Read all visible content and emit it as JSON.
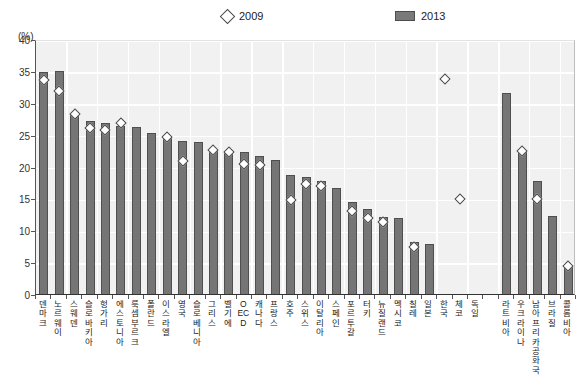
{
  "chart_data": {
    "type": "bar",
    "title": "",
    "xlabel": "",
    "ylabel": "(%)",
    "ylim": [
      0,
      40
    ],
    "yticks": [
      0,
      5,
      10,
      15,
      20,
      25,
      30,
      35,
      40
    ],
    "grid": true,
    "legend_position": "top",
    "categories": [
      "덴마크",
      "노르웨이",
      "스웨덴",
      "슬로바키아",
      "헝가리",
      "에스토니아",
      "룩셈부르크",
      "폴란드",
      "이스라엘",
      "영국",
      "슬로베니아",
      "그리스",
      "벨기에",
      "OECD",
      "캐나다",
      "프랑스",
      "호주",
      "스위스",
      "이탈리아",
      "스페인",
      "포르투갈",
      "터키",
      "뉴질랜드",
      "멕시코",
      "칠레",
      "일본",
      "한국",
      "체코",
      "독일",
      "",
      "라트비아",
      "우크라이나",
      "남아프리카공화국",
      "브라질",
      "콜롬비아"
    ],
    "series": [
      {
        "name": "2013",
        "marker": "bar",
        "color": "#757575",
        "values": [
          34.8,
          35.0,
          28.3,
          27.1,
          26.8,
          26.4,
          26.2,
          25.3,
          24.8,
          24.0,
          23.9,
          22.6,
          22.5,
          22.2,
          21.6,
          21.0,
          18.7,
          18.3,
          17.7,
          16.7,
          14.4,
          13.3,
          12.1,
          11.9,
          8.1,
          7.8,
          null,
          null,
          null,
          null,
          31.5,
          22.2,
          17.8,
          12.2,
          4.3
        ]
      },
      {
        "name": "2009",
        "marker": "diamond",
        "color": "#ffffff",
        "values": [
          34.2,
          32.4,
          28.9,
          26.7,
          26.3,
          27.5,
          null,
          null,
          25.3,
          21.5,
          null,
          23.2,
          22.9,
          21.0,
          20.9,
          null,
          15.3,
          17.9,
          17.5,
          null,
          13.6,
          12.6,
          12.0,
          null,
          8.0,
          null,
          34.3,
          15.6,
          null,
          null,
          null,
          23.0,
          15.5,
          null,
          5.0
        ]
      }
    ]
  },
  "legend": {
    "items": [
      {
        "label": "2009",
        "marker": "diamond"
      },
      {
        "label": "2013",
        "marker": "bar"
      }
    ]
  },
  "axis": {
    "unit_label": "(%)"
  },
  "footnote": {
    "text": ""
  }
}
